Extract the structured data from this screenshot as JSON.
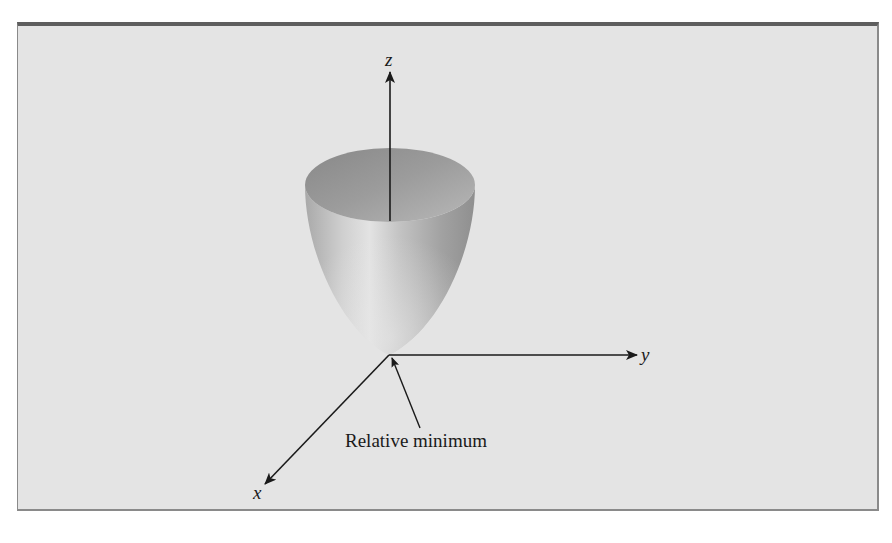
{
  "figure": {
    "type": "3d-surface-diagram",
    "surface": "paraboloid (bowl opening upward)",
    "axes": {
      "z_label": "z",
      "y_label": "y",
      "x_label": "x"
    },
    "annotation": {
      "label": "Relative minimum",
      "points_to": "vertex of paraboloid at origin"
    },
    "colors": {
      "background": "#e4e4e4",
      "frame_top_border": "#5e5e5e",
      "axis": "#1a1a1a",
      "surface_light": "#d8d8d8",
      "surface_dark": "#8c8c8c"
    }
  }
}
